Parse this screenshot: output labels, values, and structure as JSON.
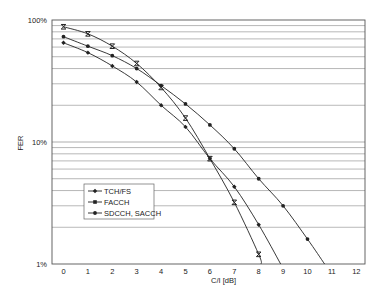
{
  "chart_data": {
    "type": "line",
    "title": "",
    "xlabel": "C/I [dB]",
    "ylabel": "FER",
    "yscale": "log",
    "xlim": [
      -0.5,
      12.5
    ],
    "ylim": [
      1,
      100
    ],
    "x_ticks": [
      "0",
      "1",
      "2",
      "3",
      "4",
      "5",
      "6",
      "7",
      "8",
      "9",
      "10",
      "11",
      "12"
    ],
    "y_ticks": [
      {
        "value": 100,
        "label": "100%"
      },
      {
        "value": 10,
        "label": "10%"
      },
      {
        "value": 1,
        "label": "1%"
      }
    ],
    "grid": {
      "horizontal": true,
      "minor_log_gridlines": true,
      "vertical": false
    },
    "legend_position": "lower-left inside plot",
    "series": [
      {
        "name": "TCH/FS",
        "marker": "diamond",
        "x": [
          0,
          1,
          2,
          3,
          4,
          5,
          6,
          7,
          8,
          8.9
        ],
        "values": [
          65,
          54,
          42,
          31,
          20,
          13.3,
          7.3,
          4.3,
          2.1,
          1.0
        ],
        "marker_count": 9
      },
      {
        "name": "FACCH",
        "marker": "x-square",
        "x": [
          0,
          1,
          2,
          3,
          4,
          5,
          6,
          7,
          8,
          8.1
        ],
        "values": [
          88,
          77,
          61,
          44,
          28,
          15.7,
          7.3,
          3.2,
          1.2,
          1.0
        ],
        "marker_count": 9
      },
      {
        "name": "SDCCH, SACCH",
        "marker": "circle",
        "x": [
          0,
          1,
          2,
          3,
          4,
          5,
          6,
          7,
          8,
          9,
          10,
          10.7
        ],
        "values": [
          73,
          61,
          51,
          40,
          29,
          20.5,
          13.8,
          8.8,
          5.0,
          3.0,
          1.6,
          1.0
        ],
        "marker_count": 11
      }
    ]
  },
  "axes": {
    "xlabel": "C/I [dB]",
    "ylabel": "FER",
    "y_labels": [
      "100%",
      "10%",
      "1%"
    ]
  },
  "legend": {
    "items": [
      "TCH/FS",
      "FACCH",
      "SDCCH, SACCH"
    ]
  },
  "colors": {
    "line": "#222222",
    "grid": "#9a9a9a",
    "frame": "#555555"
  }
}
